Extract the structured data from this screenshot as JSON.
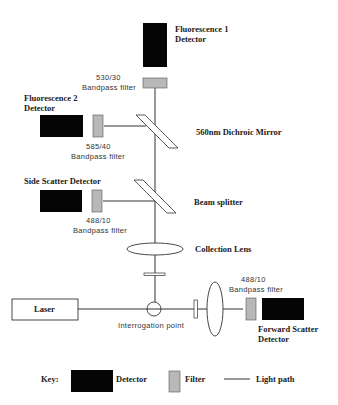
{
  "colors": {
    "detector": "#050505",
    "filter": "#b8b8b8",
    "line": "#333333",
    "background": "#ffffff"
  },
  "components": {
    "fl1_detector": {
      "label_line1": "Fluorescence 1",
      "label_line2": "Detector"
    },
    "fl1_filter": {
      "label_line1": "530/30",
      "label_line2": "Bandpass  filter"
    },
    "fl2_detector": {
      "label_line1": "Fluorescence 2",
      "label_line2": "Detector"
    },
    "fl2_filter": {
      "label_line1": "585/40",
      "label_line2": "Bandpass  filter"
    },
    "dichroic_mirror": {
      "label": "560nm Dichroic Mirror"
    },
    "ss_detector": {
      "label": "Side Scatter Detector"
    },
    "ss_filter": {
      "label_line1": "488/10",
      "label_line2": "Bandpass  filter"
    },
    "beam_splitter": {
      "label": "Beam splitter"
    },
    "collection_lens": {
      "label": "Collection Lens"
    },
    "laser": {
      "label": "Laser"
    },
    "interrogation_point": {
      "label": "Interrogation  point"
    },
    "fs_filter": {
      "label_line1": "488/10",
      "label_line2": "Bandpass  filter"
    },
    "fs_detector": {
      "label_line1": "Forward  Scatter",
      "label_line2": "Detector"
    }
  },
  "key": {
    "title": "Key:",
    "detector_label": "Detector",
    "filter_label": "Filter",
    "light_path_label": "Light path"
  }
}
